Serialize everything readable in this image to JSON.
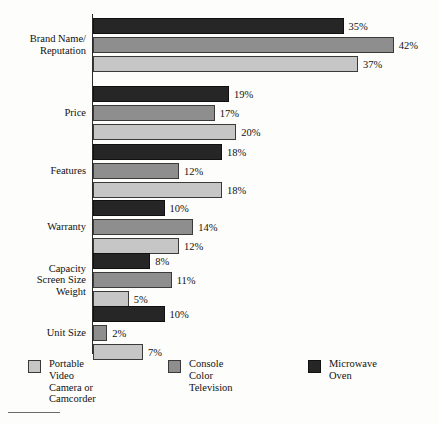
{
  "chart_data": {
    "type": "bar",
    "orientation": "horizontal",
    "title": "",
    "subtitle": "",
    "xlabel": "",
    "ylabel": "",
    "xlim": [
      0,
      42
    ],
    "grid": false,
    "legend_position": "bottom",
    "value_suffix": "%",
    "categories": [
      "Brand Name/\nReputation",
      "Price",
      "Features",
      "Warranty",
      "Capacity\nScreen Size\nWeight",
      "Unit Size"
    ],
    "category_lines": [
      [
        "Brand Name/",
        "Reputation"
      ],
      [
        "Price"
      ],
      [
        "Features"
      ],
      [
        "Warranty"
      ],
      [
        "Capacity",
        "Screen Size",
        "Weight"
      ],
      [
        "Unit Size"
      ]
    ],
    "series": [
      {
        "name": "Microwave Oven",
        "color": "#262626",
        "values": [
          35,
          19,
          18,
          10,
          8,
          10
        ],
        "labels": [
          "35%",
          "19%",
          "18%",
          "10%",
          "8%",
          "10%"
        ]
      },
      {
        "name": "Console Color Television",
        "color": "#8e8e8e",
        "values": [
          42,
          17,
          12,
          14,
          11,
          2
        ],
        "labels": [
          "42%",
          "17%",
          "12%",
          "14%",
          "11%",
          "2%"
        ]
      },
      {
        "name": "Portable Video Camera or Camcorder",
        "color": "#c6c6c6",
        "values": [
          37,
          20,
          18,
          12,
          5,
          7
        ],
        "labels": [
          "37%",
          "20%",
          "18%",
          "12%",
          "5%",
          "7%"
        ]
      }
    ]
  },
  "legend": {
    "items": [
      {
        "label": "Portable Video\nCamera or\nCamcorder",
        "color": "#c6c6c6",
        "swatch": "s2"
      },
      {
        "label": "Console Color\nTelevision",
        "color": "#8e8e8e",
        "swatch": "s1"
      },
      {
        "label": "Microwave Oven",
        "color": "#262626",
        "swatch": "s0"
      }
    ]
  }
}
